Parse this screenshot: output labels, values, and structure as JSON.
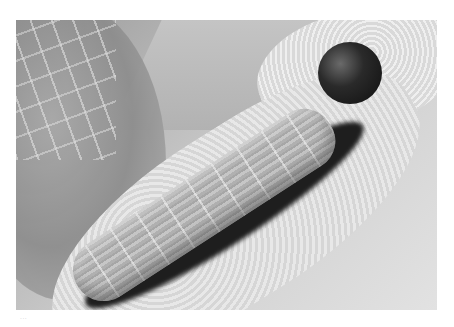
{
  "image": {
    "subject": "caterpillar on leaf",
    "description": "Close-up grayscale photograph of a striped caterpillar with a dark round head resting diagonally on a chewed leaf",
    "colors": {
      "background": "#ffffff",
      "head": "#1a1a1a",
      "body": "#b8b8b8",
      "leaf": "#e0e0e0",
      "shadow": "#1e1e1e"
    }
  },
  "caption": {
    "text": "..."
  }
}
